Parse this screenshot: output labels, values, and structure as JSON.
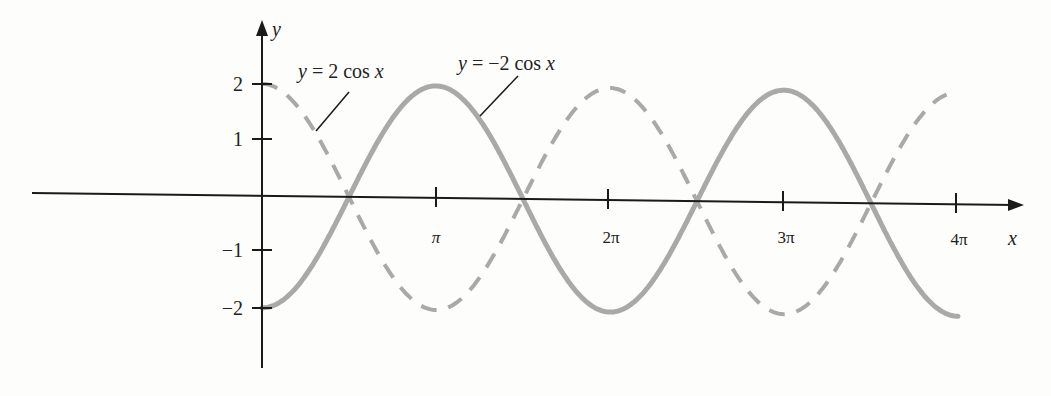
{
  "chart_data": {
    "type": "line",
    "title": "",
    "xlabel": "x",
    "ylabel": "y",
    "xlim": [
      0,
      12.566
    ],
    "ylim": [
      -2.5,
      2.5
    ],
    "x_ticks": [
      "π",
      "2π",
      "3π",
      "4π"
    ],
    "y_ticks": [
      "2",
      "1",
      "−1",
      "−2"
    ],
    "grid": false,
    "legend_position": "annotations",
    "series": [
      {
        "name": "y = 2 cos x",
        "style": "dashed",
        "color": "#a8a8a8",
        "x": [
          0,
          1.5708,
          3.1416,
          4.7124,
          6.2832,
          7.854,
          9.4248,
          10.9956,
          12.5664
        ],
        "values": [
          2,
          0,
          -2,
          0,
          2,
          0,
          -2,
          0,
          2
        ]
      },
      {
        "name": "y = −2 cos x",
        "style": "solid",
        "color": "#a8a8a8",
        "x": [
          0,
          1.5708,
          3.1416,
          4.7124,
          6.2832,
          7.854,
          9.4248,
          10.9956,
          12.5664
        ],
        "values": [
          -2,
          0,
          2,
          0,
          -2,
          0,
          2,
          0,
          -2
        ]
      }
    ],
    "annotations": [
      {
        "text": "y = 2 cos x",
        "target": "dashed curve"
      },
      {
        "text": "y = −2 cos x",
        "target": "solid curve"
      }
    ]
  },
  "labels": {
    "y_axis": "y",
    "x_axis": "x",
    "tick_pi": "π",
    "tick_2pi": "2π",
    "tick_3pi": "3π",
    "tick_4pi": "4π",
    "tick_y2": "2",
    "tick_y1": "1",
    "tick_ym1": "−1",
    "tick_ym2": "−2",
    "annot_pos": "y = 2 cos x",
    "annot_neg": "y = −2 cos x"
  }
}
